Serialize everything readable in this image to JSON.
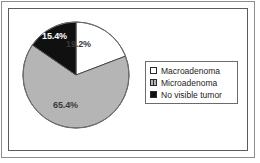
{
  "chart_data": {
    "type": "pie",
    "title": "",
    "subtitle": "",
    "xlabel": "",
    "ylabel": "",
    "grid": false,
    "legend_position": "right",
    "start_angle_deg": 0,
    "direction": "clockwise",
    "categories": [
      "Macroadenoma",
      "Microadenoma",
      "No visible tumor"
    ],
    "values": [
      19.2,
      65.4,
      15.4
    ],
    "value_unit": "%",
    "data_labels": [
      "19.2%",
      "65.4%",
      "15.4%"
    ],
    "slice_colors": [
      "#ffffff",
      "#b5b5b5",
      "#101010"
    ],
    "slice_edge_color": "#4a4a4a",
    "label_colors": [
      "#3a3a3a",
      "#3a3a3a",
      "#ffffff"
    ],
    "legend": [
      {
        "label": "Macroadenoma",
        "swatch": "white",
        "color": "#ffffff"
      },
      {
        "label": "Microadenoma",
        "swatch": "gray-hatched",
        "color": "#b5b5b5"
      },
      {
        "label": "No visible tumor",
        "swatch": "black",
        "color": "#101010"
      }
    ]
  },
  "frame": {
    "outer_border_color": "#8d8d8d",
    "inner_border_color": "#5c5c5c",
    "background": "#ffffff"
  },
  "icons": {
    "legend_swatch_macro": "square-outline-icon",
    "legend_swatch_micro": "square-hatched-icon",
    "legend_swatch_novis": "square-filled-icon"
  }
}
